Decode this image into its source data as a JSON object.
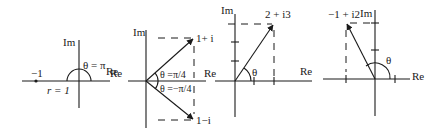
{
  "colors": {
    "ink": "#1a1a1a",
    "background": "#ffffff"
  },
  "panels": [
    {
      "id": "minus-one",
      "axis_labels": {
        "im": "Im",
        "re": "Re"
      },
      "point_label": "−1",
      "angle_label": "θ = π",
      "radius_label": "r = 1"
    },
    {
      "id": "one-plus-minus-i",
      "axis_labels": {
        "im": "Im",
        "re": "Re",
        "re_left": "Re"
      },
      "points": [
        {
          "label": "1+ i"
        },
        {
          "label": "1−i"
        }
      ],
      "angle_labels": [
        "θ =π/4",
        "θ =−π/4"
      ]
    },
    {
      "id": "two-plus-i3",
      "axis_labels": {
        "im": "Im",
        "re": "Re"
      },
      "point_label": "2 + i3",
      "angle_label": "θ"
    },
    {
      "id": "minus-one-plus-i2",
      "axis_labels": {
        "im": "Im",
        "re": "Re"
      },
      "point_label": "−1 + i2",
      "angle_label": "θ"
    }
  ]
}
